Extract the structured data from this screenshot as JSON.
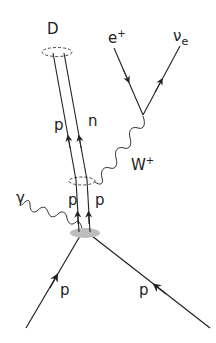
{
  "diagram": {
    "type": "feynman",
    "colors": {
      "line": "#222222",
      "blob": "#bdbdbd",
      "background": "#ffffff"
    },
    "labels": {
      "deuteron": "D",
      "positron": "e",
      "positron_sup": "+",
      "neutrino": "ν",
      "neutrino_sub": "e",
      "w_boson": "W",
      "w_boson_sup": "+",
      "photon": "γ",
      "proton_upper": "p",
      "neutron_upper": "n",
      "proton_mid_left": "p",
      "proton_mid_right": "p",
      "proton_in_left": "p",
      "proton_in_right": "p"
    },
    "nodes": [
      {
        "id": "deuteron-bound",
        "shape": "dashed-ellipse"
      },
      {
        "id": "pp-bound",
        "shape": "dashed-ellipse"
      },
      {
        "id": "interaction-blob",
        "shape": "gray-ellipse"
      },
      {
        "id": "weak-vertex",
        "shape": "vertex"
      }
    ],
    "edges": [
      {
        "from": "incoming-proton-left",
        "to": "interaction-blob",
        "type": "fermion"
      },
      {
        "from": "incoming-proton-right",
        "to": "interaction-blob",
        "type": "fermion"
      },
      {
        "from": "interaction-blob",
        "to": "photon-out",
        "type": "photon"
      },
      {
        "from": "interaction-blob",
        "to": "pp-bound",
        "type": "fermion-pair"
      },
      {
        "from": "pp-bound",
        "to": "deuteron-bound",
        "type": "fermion-pair",
        "labels": [
          "p",
          "n"
        ]
      },
      {
        "from": "pp-bound",
        "to": "weak-vertex",
        "type": "W-boson"
      },
      {
        "from": "weak-vertex",
        "to": "positron",
        "type": "antifermion"
      },
      {
        "from": "weak-vertex",
        "to": "neutrino",
        "type": "fermion"
      }
    ]
  }
}
